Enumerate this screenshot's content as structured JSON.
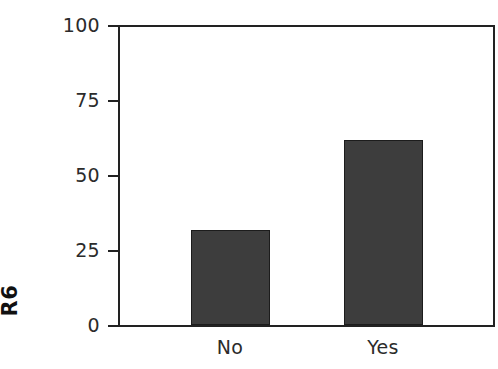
{
  "chart_data": {
    "type": "bar",
    "title": "",
    "subtitle": "",
    "xlabel": "",
    "ylabel": "R6",
    "categories": [
      "No",
      "Yes"
    ],
    "values": [
      32,
      62
    ],
    "series": [
      {
        "name": "R6",
        "values": [
          32,
          62
        ]
      }
    ],
    "ylim": [
      0,
      100
    ],
    "yticks": [
      0,
      25,
      50,
      75,
      100
    ],
    "ytick_labels": [
      "0",
      "25",
      "50",
      "75",
      "100"
    ],
    "xtick_labels": [
      "No",
      "Yes"
    ],
    "grid": false,
    "legend": false,
    "legend_position": "none",
    "annotations": [],
    "colors": {
      "bar_fill": "#3d3d3d",
      "bar_edge": "#1c1c1c",
      "axis": "#222222",
      "text": "#2b2b2b",
      "ylabel_text": "#111111",
      "background": "#ffffff"
    }
  }
}
